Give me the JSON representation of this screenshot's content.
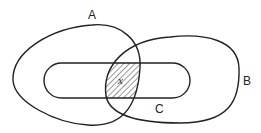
{
  "diagram": {
    "type": "venn",
    "sets": [
      {
        "id": "A",
        "label": "A"
      },
      {
        "id": "B",
        "label": "B"
      },
      {
        "id": "C",
        "label": "C"
      }
    ],
    "shaded_region": {
      "description": "A ∩ B ∩ C",
      "label": "x"
    },
    "colors": {
      "stroke": "#222222",
      "background": "#ffffff",
      "hatch": "#333333"
    }
  }
}
